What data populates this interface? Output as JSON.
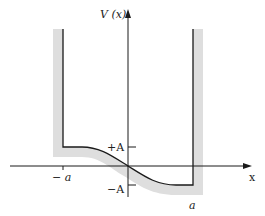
{
  "diagram": {
    "y_axis_label": "V (x)",
    "x_axis_label": "x",
    "tick_labels": {
      "plus_A": "+A",
      "minus_A": "−A",
      "minus_a": "− a",
      "plus_a": "a"
    },
    "colors": {
      "line": "#1a1a1a",
      "shading": "#dedede",
      "background": "#ffffff"
    }
  }
}
